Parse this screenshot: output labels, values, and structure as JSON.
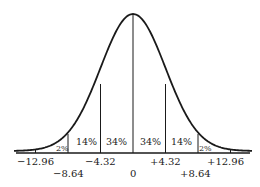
{
  "chart_data": {
    "type": "area",
    "title": "",
    "mean": 0,
    "std_dev": 4.32,
    "x_ticks_row1": [
      "-12.96",
      "-4.32",
      "+4.32",
      "+12.96"
    ],
    "x_ticks_row2": [
      "-8.64",
      "0",
      "+8.64"
    ],
    "x_tick_values": [
      -12.96,
      -8.64,
      -4.32,
      0,
      4.32,
      8.64,
      12.96
    ],
    "regions": [
      {
        "from": -12.96,
        "to": -8.64,
        "label": "2%",
        "value": 2
      },
      {
        "from": -8.64,
        "to": -4.32,
        "label": "14%",
        "value": 14
      },
      {
        "from": -4.32,
        "to": 0,
        "label": "34%",
        "value": 34
      },
      {
        "from": 0,
        "to": 4.32,
        "label": "34%",
        "value": 34
      },
      {
        "from": 4.32,
        "to": 8.64,
        "label": "14%",
        "value": 14
      },
      {
        "from": 8.64,
        "to": 12.96,
        "label": "2%",
        "value": 2
      }
    ],
    "line_color": "#1a1a1a",
    "text_color": "#222222"
  },
  "labels": {
    "pct_left_tail": "2%",
    "pct_left_mid": "14%",
    "pct_left_center": "34%",
    "pct_right_center": "34%",
    "pct_right_mid": "14%",
    "pct_right_tail": "2%",
    "tick_m1296": "−12.96",
    "tick_m864": "−8.64",
    "tick_m432": "−4.32",
    "tick_0": "0",
    "tick_p432": "+4.32",
    "tick_p864": "+8.64",
    "tick_p1296": "+12.96"
  }
}
